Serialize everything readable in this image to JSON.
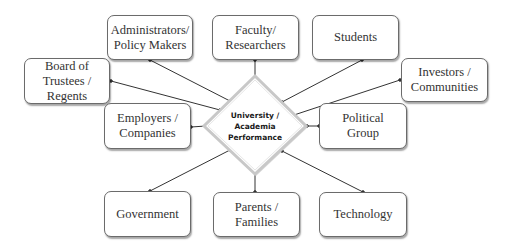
{
  "diagram": {
    "center": {
      "label": "University /\nAcademia\nPerformance"
    },
    "nodes": [
      {
        "id": "administrators",
        "label": "Administrators/\nPolicy Makers"
      },
      {
        "id": "faculty",
        "label": "Faculty/\nResearchers"
      },
      {
        "id": "students",
        "label": "Students"
      },
      {
        "id": "board",
        "label": "Board of\nTrustees /\nRegents"
      },
      {
        "id": "investors",
        "label": "Investors /\nCommunities"
      },
      {
        "id": "employers",
        "label": "Employers /\nCompanies"
      },
      {
        "id": "political",
        "label": "Political\nGroup"
      },
      {
        "id": "government",
        "label": "Government"
      },
      {
        "id": "parents",
        "label": "Parents /\nFamilies"
      },
      {
        "id": "technology",
        "label": "Technology"
      }
    ],
    "colors": {
      "border": "#6b6b6b",
      "line": "#333333",
      "text": "#333333"
    }
  }
}
